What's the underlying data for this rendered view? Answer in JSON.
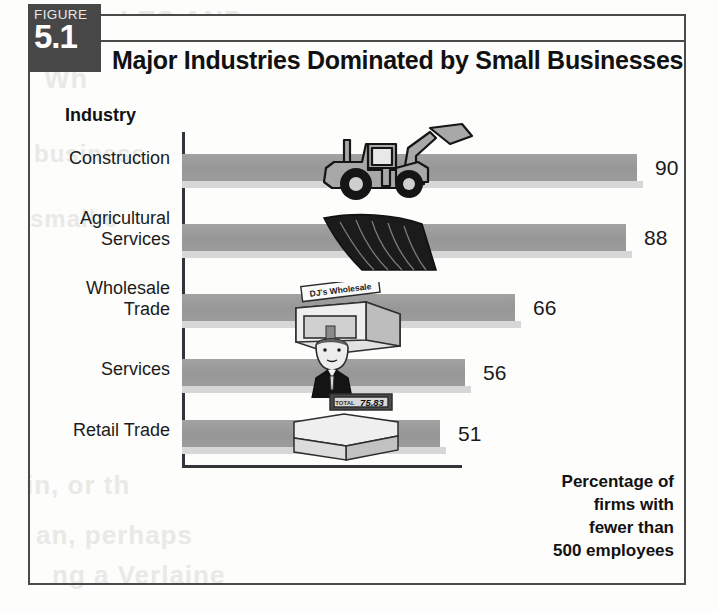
{
  "figure": {
    "badge_word": "FIGURE",
    "badge_number": "5.1",
    "title": "Major Industries Dominated by Small Businesses"
  },
  "axis_title": "Industry",
  "caption": "Percentage of\nfirms with\nfewer than\n500 employees",
  "colors": {
    "bar": "#9c9c9c",
    "bar_shadow": "#d7d7d7",
    "axis": "#33333a",
    "badge_bg": "#474747",
    "text": "#111111",
    "frame": "#4a4a4a"
  },
  "illustrations": [
    {
      "name": "backhoe-loader-illustration",
      "row": 0
    },
    {
      "name": "plow-blade-illustration",
      "row": 1
    },
    {
      "name": "wholesale-warehouse-illustration",
      "row": 2,
      "sign_text": "DJ's Wholesale"
    },
    {
      "name": "businessman-illustration",
      "row": 3
    },
    {
      "name": "cash-register-illustration",
      "row": 4,
      "display_text": "75.83"
    }
  ],
  "bleed_through": [
    "LES AND",
    "Wh",
    "business",
    "small c",
    "in, or th",
    "an, perhaps",
    "ng a  Verlaine"
  ],
  "chart_data": {
    "type": "bar",
    "orientation": "horizontal",
    "title": "Major Industries Dominated by Small Businesses",
    "xlabel": "Percentage of firms with fewer than 500 employees",
    "ylabel": "Industry",
    "categories": [
      "Construction",
      "Agricultural\nServices",
      "Wholesale\nTrade",
      "Services",
      "Retail Trade"
    ],
    "values": [
      90,
      88,
      66,
      56,
      51
    ],
    "value_labels": [
      "90",
      "88",
      "66",
      "56",
      "51"
    ],
    "xlim": [
      0,
      100
    ],
    "grid": false,
    "legend": false,
    "units": "percent"
  }
}
